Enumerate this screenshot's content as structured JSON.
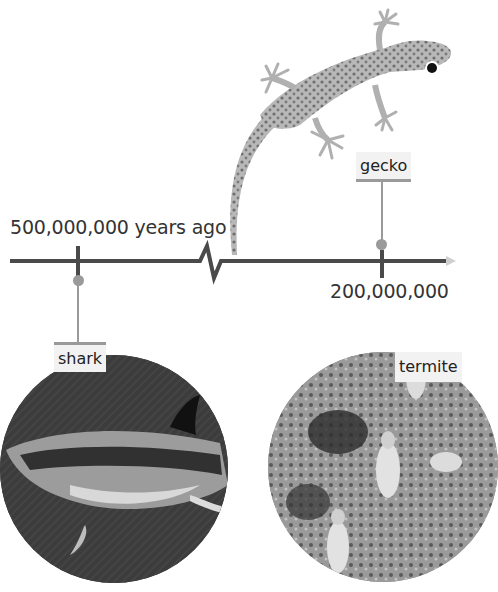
{
  "timeline": {
    "start_label": "500,000,000 years ago",
    "end_tick_label": "200,000,000",
    "line_color": "#4a4a4a",
    "connector_color": "#9a9a9a"
  },
  "animals": [
    {
      "name": "gecko",
      "label": "gecko",
      "position": "above",
      "tick": "200,000,000"
    },
    {
      "name": "shark",
      "label": "shark",
      "position": "below",
      "tick": "500,000,000"
    },
    {
      "name": "termite",
      "label": "termite",
      "position": "below",
      "tick": "cut-off"
    }
  ]
}
